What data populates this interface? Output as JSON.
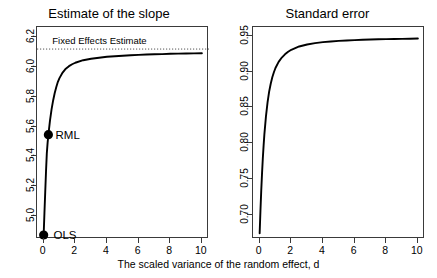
{
  "figure": {
    "shared_xlabel": "The scaled variance of the random effect, d",
    "line_color": "#000000",
    "axis_color": "#3a3a3a",
    "reference_line_color": "#555555"
  },
  "panels": [
    {
      "name": "estimate-of-the-slope",
      "title": "Estimate of the slope",
      "xticks": [
        "0",
        "2",
        "4",
        "6",
        "8",
        "10"
      ],
      "yticks": [
        "5.0",
        "5.2",
        "5.4",
        "5.6",
        "5.8",
        "6.0",
        "6.2"
      ],
      "annotations": [
        {
          "name": "fixed-effects-estimate-label",
          "text": "Fixed Effects Estimate"
        }
      ],
      "points": [
        {
          "name": "ols",
          "label": "OLS"
        },
        {
          "name": "rml",
          "label": "RML"
        }
      ]
    },
    {
      "name": "standard-error",
      "title": "Standard error",
      "xticks": [
        "0",
        "2",
        "4",
        "6",
        "8",
        "10"
      ],
      "yticks": [
        "0.70",
        "0.75",
        "0.80",
        "0.85",
        "0.90",
        "0.95"
      ],
      "annotations": [],
      "points": []
    }
  ],
  "chart_data": [
    {
      "type": "line",
      "name": "estimate-of-the-slope",
      "title": "Estimate of the slope",
      "xlabel": "The scaled variance of the random effect, d",
      "ylabel": "",
      "xlim": [
        -0.42,
        10.45
      ],
      "ylim": [
        4.845,
        6.268
      ],
      "xticks": [
        0,
        2,
        4,
        6,
        8,
        10
      ],
      "yticks": [
        5.0,
        5.2,
        5.4,
        5.6,
        5.8,
        6.0,
        6.2
      ],
      "grid": false,
      "legend": "none",
      "reference_lines": [
        {
          "label": "Fixed Effects Estimate",
          "orientation": "horizontal",
          "y": 6.12,
          "style": "dotted"
        }
      ],
      "annotations": [
        {
          "text": "Fixed Effects Estimate",
          "x": 0.55,
          "y": 6.175
        },
        {
          "text": "RML",
          "x": 0.75,
          "y": 5.545
        },
        {
          "text": "OLS",
          "x": 0.62,
          "y": 4.875
        }
      ],
      "markers": [
        {
          "label": "OLS",
          "x": 0.0,
          "y": 4.872
        },
        {
          "label": "RML",
          "x": 0.3,
          "y": 5.545
        }
      ],
      "series": [
        {
          "name": "slope estimate",
          "x": [
            0,
            0.05,
            0.1,
            0.15,
            0.2,
            0.25,
            0.3,
            0.4,
            0.5,
            0.6,
            0.7,
            0.8,
            0.9,
            1.0,
            1.2,
            1.4,
            1.6,
            1.8,
            2.0,
            2.5,
            3.0,
            3.5,
            4.0,
            4.5,
            5.0,
            5.5,
            6.0,
            6.5,
            7.0,
            7.5,
            8.0,
            8.5,
            9.0,
            9.5,
            10.0
          ],
          "y": [
            4.872,
            5.02,
            5.16,
            5.3,
            5.42,
            5.49,
            5.545,
            5.64,
            5.715,
            5.775,
            5.825,
            5.865,
            5.9,
            5.925,
            5.962,
            5.988,
            6.005,
            6.018,
            6.028,
            6.045,
            6.055,
            6.062,
            6.068,
            6.072,
            6.075,
            6.078,
            6.081,
            6.083,
            6.085,
            6.086,
            6.088,
            6.089,
            6.09,
            6.091,
            6.092
          ]
        }
      ]
    },
    {
      "type": "line",
      "name": "standard-error",
      "title": "Standard error",
      "xlabel": "The scaled variance of the random effect, d",
      "ylabel": "",
      "xlim": [
        -0.42,
        10.45
      ],
      "ylim": [
        0.667,
        0.962
      ],
      "xticks": [
        0,
        2,
        4,
        6,
        8,
        10
      ],
      "yticks": [
        0.7,
        0.75,
        0.8,
        0.85,
        0.9,
        0.95
      ],
      "grid": false,
      "legend": "none",
      "reference_lines": [],
      "annotations": [],
      "markers": [],
      "series": [
        {
          "name": "standard error",
          "x": [
            0,
            0.05,
            0.1,
            0.15,
            0.2,
            0.25,
            0.3,
            0.4,
            0.5,
            0.6,
            0.7,
            0.8,
            0.9,
            1.0,
            1.2,
            1.4,
            1.6,
            1.8,
            2.0,
            2.5,
            3.0,
            3.5,
            4.0,
            4.5,
            5.0,
            5.5,
            6.0,
            6.5,
            7.0,
            7.5,
            8.0,
            8.5,
            9.0,
            9.5,
            10.0
          ],
          "y": [
            0.675,
            0.706,
            0.734,
            0.758,
            0.779,
            0.797,
            0.813,
            0.838,
            0.857,
            0.872,
            0.883,
            0.892,
            0.899,
            0.905,
            0.9135,
            0.9195,
            0.924,
            0.9275,
            0.9303,
            0.9349,
            0.9377,
            0.9396,
            0.9409,
            0.9419,
            0.9427,
            0.9433,
            0.9438,
            0.9442,
            0.9446,
            0.9449,
            0.9451,
            0.9453,
            0.9455,
            0.9457,
            0.9459
          ]
        }
      ]
    }
  ]
}
